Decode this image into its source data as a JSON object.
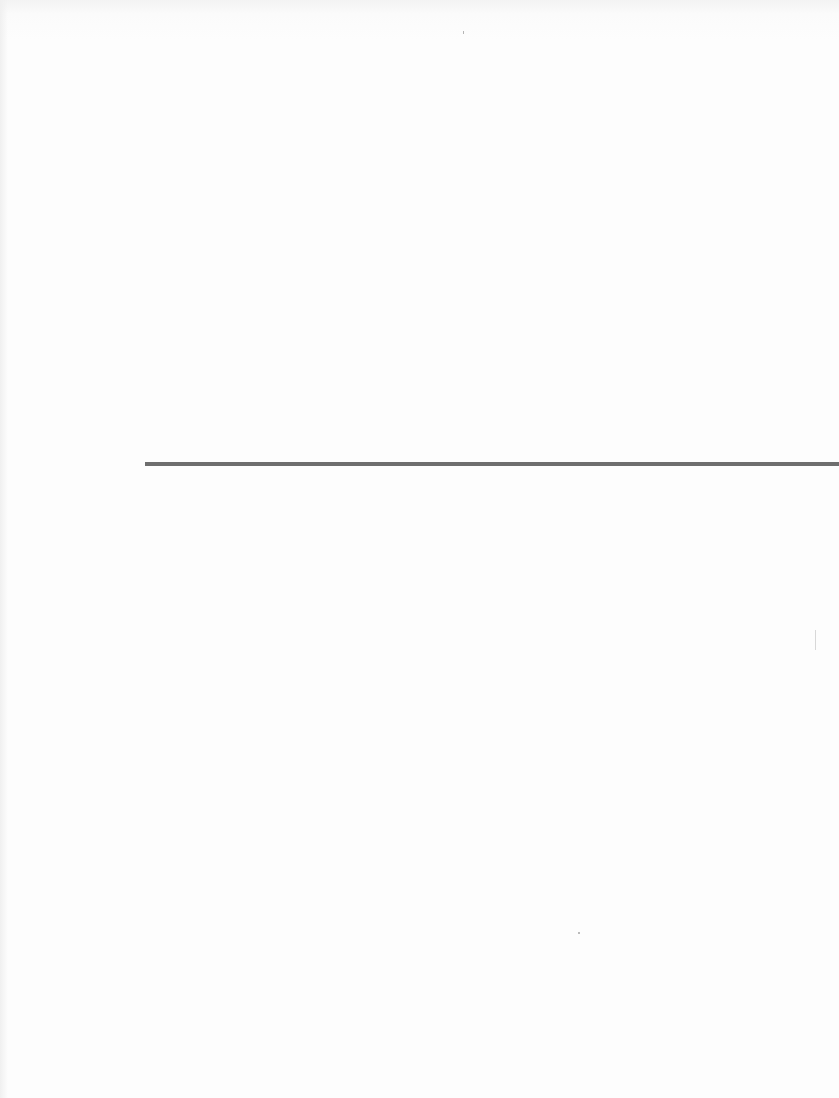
{
  "page": {
    "background_color": "#fdfdfd",
    "rule_color": "#6e6e6e",
    "text": ""
  }
}
